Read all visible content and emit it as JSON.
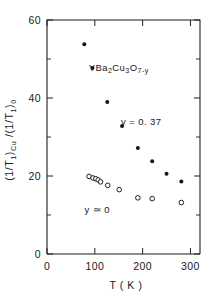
{
  "chart_data": {
    "type": "scatter",
    "title": "",
    "xlabel": "T ( K )",
    "ylabel": "(1/T1)Cu /(1/T1)0",
    "xlim": [
      0,
      320
    ],
    "ylim": [
      0,
      60
    ],
    "xticks": [
      0,
      100,
      200,
      300
    ],
    "xtick_labels": [
      "0",
      "100",
      "200",
      "300"
    ],
    "yticks": [
      0,
      20,
      40,
      60
    ],
    "ytick_labels": [
      "0",
      "20",
      "40",
      "60"
    ],
    "yticks_minor": [
      10,
      30,
      50
    ],
    "grid": false,
    "legend_position": "inline-annotations",
    "annotations": [
      {
        "id": "compound",
        "text": "YBa2Cu3O7-y",
        "x": 150,
        "y": 47
      },
      {
        "id": "series-1-label",
        "text": "y = 0. 37",
        "x": 197,
        "y": 33
      },
      {
        "id": "series-2-label",
        "text": "y ≃ 0",
        "x": 105,
        "y": 10.5
      }
    ],
    "series": [
      {
        "name": "y = 0.37",
        "marker": "filled-circle",
        "color": "#141414",
        "points": [
          {
            "x": 78,
            "y": 53.8
          },
          {
            "x": 95,
            "y": 47.7
          },
          {
            "x": 126,
            "y": 39.0
          },
          {
            "x": 157,
            "y": 32.8
          },
          {
            "x": 190,
            "y": 27.2
          },
          {
            "x": 220,
            "y": 23.8
          },
          {
            "x": 250,
            "y": 20.6
          },
          {
            "x": 281,
            "y": 18.6
          }
        ]
      },
      {
        "name": "y ≃ 0",
        "marker": "open-circle",
        "color": "#141414",
        "points": [
          {
            "x": 88,
            "y": 19.9
          },
          {
            "x": 96,
            "y": 19.5
          },
          {
            "x": 102,
            "y": 19.3
          },
          {
            "x": 107,
            "y": 19.0
          },
          {
            "x": 112,
            "y": 18.5
          },
          {
            "x": 127,
            "y": 17.6
          },
          {
            "x": 151,
            "y": 16.5
          },
          {
            "x": 190,
            "y": 14.4
          },
          {
            "x": 220,
            "y": 14.2
          },
          {
            "x": 281,
            "y": 13.2
          }
        ]
      }
    ]
  }
}
